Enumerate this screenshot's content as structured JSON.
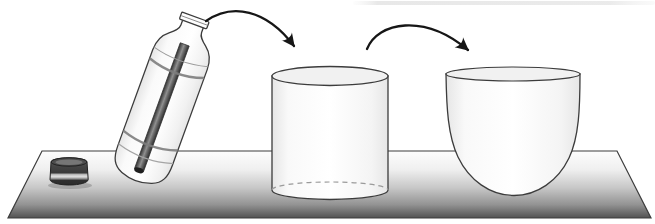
{
  "meta": {
    "canvas": {
      "width": 655,
      "height": 224
    }
  },
  "scene": {
    "objects": [
      {
        "id": "bottle",
        "label": "tilted open bottle containing a dark rod"
      },
      {
        "id": "bottle-cap",
        "label": "bottle cap lying on the table"
      },
      {
        "id": "transfer-arrow-1",
        "label": "curved arrow from bottle mouth to cylinder"
      },
      {
        "id": "cylinder",
        "label": "cylindrical container with dashed hidden bottom edge"
      },
      {
        "id": "transfer-arrow-2",
        "label": "curved arrow from cylinder to bowl"
      },
      {
        "id": "bowl",
        "label": "round-bottomed bowl"
      },
      {
        "id": "tabletop",
        "label": "perspective table surface shaded light to dark"
      },
      {
        "id": "top-streak",
        "label": "faint gray streak along top right edge"
      }
    ]
  },
  "colors": {
    "outline": "#3c3c3c",
    "arrow": "#161616",
    "background": "#ffffff",
    "surface-top": "#fdfdfd",
    "surface-mid": "#c7c7c7",
    "surface-dark": "#525252",
    "vessel-edge": "#e6e6e6",
    "vessel-face": "#ffffff",
    "vessel-interior": "#f1f1f1",
    "rod-dark": "#333333",
    "rod-mid": "#909090",
    "cap-dark": "#2c2c2c",
    "cap-mid": "#464646",
    "cap-light": "#e0e0e0",
    "dash": "#9a9a9a",
    "streak": "#e4e4e4"
  }
}
